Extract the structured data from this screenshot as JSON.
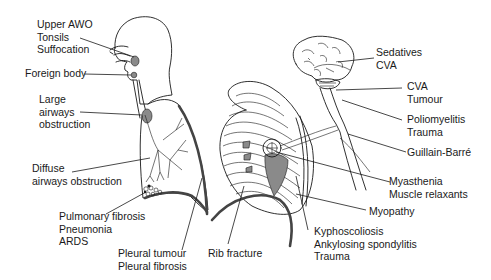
{
  "diagram": {
    "title": "",
    "type": "anatomical causes of respiratory failure",
    "colors": {
      "ink": "#1a1a1a",
      "lesion": "#8a8a8a",
      "background": "#ffffff"
    },
    "labels": {
      "upper_airway": {
        "lines": [
          "Upper AWO",
          "Tonsils",
          "Suffocation"
        ]
      },
      "foreign_body": {
        "lines": [
          "Foreign body"
        ]
      },
      "large_airways": {
        "lines": [
          "Large",
          "airways",
          "obstruction"
        ]
      },
      "diffuse_airways": {
        "lines": [
          "Diffuse",
          "airways obstruction"
        ]
      },
      "parenchyma": {
        "lines": [
          "Pulmonary fibrosis",
          "Pneumonia",
          "ARDS"
        ]
      },
      "pleura": {
        "lines": [
          "Pleural tumour",
          "Pleural fibrosis"
        ]
      },
      "rib": {
        "lines": [
          "Rib fracture"
        ]
      },
      "spine": {
        "lines": [
          "Kyphoscoliosis",
          "Ankylosing spondylitis",
          "Trauma"
        ]
      },
      "muscle": {
        "lines": [
          "Myopathy"
        ]
      },
      "nmj": {
        "lines": [
          "Myasthenia",
          "Muscle relaxants"
        ]
      },
      "nerve": {
        "lines": [
          "Guillain-Barré"
        ]
      },
      "spinal_cord": {
        "lines": [
          "Poliomyelitis",
          "Trauma"
        ]
      },
      "brainstem": {
        "lines": [
          "CVA",
          "Tumour"
        ]
      },
      "brain": {
        "lines": [
          "Sedatives",
          "CVA"
        ]
      }
    },
    "illustrations": [
      "head-and-airway",
      "lungs",
      "rib-cage",
      "brain-and-spinal-cord"
    ]
  }
}
